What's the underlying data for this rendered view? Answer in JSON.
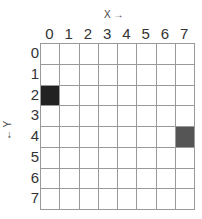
{
  "axes": {
    "x_title": "X →",
    "y_title": "← Y",
    "columns": [
      "0",
      "1",
      "2",
      "3",
      "4",
      "5",
      "6",
      "7"
    ],
    "rows": [
      "0",
      "1",
      "2",
      "3",
      "4",
      "5",
      "6",
      "7"
    ]
  },
  "grid": {
    "cols": 8,
    "rows": 8,
    "filled_cells": [
      {
        "x": 0,
        "y": 2,
        "color": "#222222"
      },
      {
        "x": 7,
        "y": 4,
        "color": "#555555"
      }
    ]
  }
}
